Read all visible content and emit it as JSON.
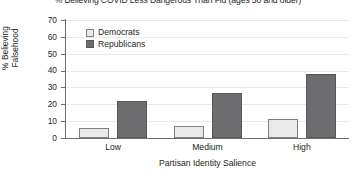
{
  "chart_data": {
    "type": "bar",
    "title": "% Believing COVID Less Dangerous Than Flu (ages 50 and older)",
    "xlabel": "Partisan Identity Salience",
    "ylabel": "% Believing Falsehood",
    "ylabel_lines": [
      "% Believing",
      "Falsehood"
    ],
    "categories": [
      "Low",
      "Medium",
      "High"
    ],
    "series": [
      {
        "name": "Democrats",
        "values": [
          6,
          7,
          11
        ],
        "color": "#e9e9e9"
      },
      {
        "name": "Republicans",
        "values": [
          22,
          27,
          38
        ],
        "color": "#6d6d6f"
      }
    ],
    "ylim": [
      0,
      70
    ],
    "yticks": [
      70,
      60,
      50,
      40,
      30,
      20,
      10,
      0
    ],
    "grid": true,
    "legend_position": "upper-left-inside"
  }
}
